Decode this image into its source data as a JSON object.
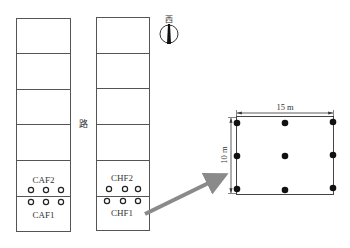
{
  "diagram": {
    "type": "field plot layout / sampling scheme",
    "road_label": "路",
    "compass_label": "西",
    "plots": [
      {
        "id": "left-column",
        "upper_label": "CAF2",
        "lower_label": "CAF1",
        "rows": 6,
        "sample_circles_per_row": 3
      },
      {
        "id": "right-column",
        "upper_label": "CHF2",
        "lower_label": "CHF1",
        "rows": 6,
        "sample_circles_per_row": 3
      }
    ],
    "detail": {
      "width_label": "15 m",
      "height_label": "10 m",
      "sample_points_grid": "3x3",
      "sample_point_count": 9
    },
    "colors": {
      "line": "#555555",
      "arrow": "#8a8a8a",
      "point": "#111111"
    }
  }
}
